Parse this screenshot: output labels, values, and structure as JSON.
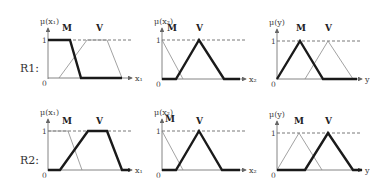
{
  "rules": [
    {
      "label": "R1:",
      "label_x": 20,
      "label_y": 72
    },
    {
      "label": "R2:",
      "label_x": 20,
      "label_y": 164
    }
  ],
  "panels": [
    {
      "id": "r1-x1",
      "ox": 48,
      "y0": 78,
      "y1": 40,
      "xend": 132,
      "ylabel": "μ(x₁)",
      "xlabel": "x₁",
      "sets": [
        {
          "name": "M",
          "label_x": 62,
          "label_y": 31,
          "bold": true,
          "points": [
            [
              48,
              40
            ],
            [
              70,
              40
            ],
            [
              81,
              78
            ],
            [
              122,
              78
            ]
          ]
        },
        {
          "name": "V",
          "label_x": 96,
          "label_y": 31,
          "bold": false,
          "points": [
            [
              59,
              78
            ],
            [
              87,
              40
            ],
            [
              107,
              40
            ],
            [
              122,
              78
            ]
          ]
        }
      ]
    },
    {
      "id": "r1-x2",
      "ox": 162,
      "y0": 79,
      "y1": 40,
      "xend": 246,
      "ylabel": "μ(x₂)",
      "xlabel": "x₂",
      "sets": [
        {
          "name": "M",
          "label_x": 167,
          "label_y": 31,
          "bold": false,
          "points": [
            [
              162,
              40
            ],
            [
              183,
              79
            ]
          ]
        },
        {
          "name": "V",
          "label_x": 196,
          "label_y": 31,
          "bold": true,
          "points": [
            [
              162,
              79
            ],
            [
              176,
              79
            ],
            [
              199,
              40
            ],
            [
              224,
              79
            ],
            [
              240,
              79
            ]
          ]
        }
      ]
    },
    {
      "id": "r1-y",
      "ox": 277,
      "y0": 79,
      "y1": 41,
      "xend": 362,
      "ylabel": "μ(y)",
      "xlabel": "y",
      "sets": [
        {
          "name": "M",
          "label_x": 296,
          "label_y": 31,
          "bold": true,
          "points": [
            [
              277,
              79
            ],
            [
              300,
              41
            ],
            [
              323,
              79
            ],
            [
              357,
              79
            ]
          ]
        },
        {
          "name": "V",
          "label_x": 325,
          "label_y": 31,
          "bold": false,
          "points": [
            [
              305,
              79
            ],
            [
              328,
              41
            ],
            [
              353,
              79
            ]
          ]
        }
      ]
    },
    {
      "id": "r2-x1",
      "ox": 48,
      "y0": 170,
      "y1": 131,
      "xend": 132,
      "ylabel": "μ(x₁)",
      "xlabel": "x₁",
      "sets": [
        {
          "name": "M",
          "label_x": 62,
          "label_y": 124,
          "bold": false,
          "points": [
            [
              48,
              131
            ],
            [
              68,
              131
            ],
            [
              82,
              170
            ]
          ]
        },
        {
          "name": "V",
          "label_x": 96,
          "label_y": 124,
          "bold": true,
          "points": [
            [
              48,
              170
            ],
            [
              60,
              170
            ],
            [
              88,
              131
            ],
            [
              107,
              131
            ],
            [
              122,
              170
            ],
            [
              130,
              170
            ]
          ]
        }
      ]
    },
    {
      "id": "r2-x2",
      "ox": 162,
      "y0": 170,
      "y1": 131,
      "xend": 246,
      "ylabel": "μ(x₂)",
      "xlabel": "x₂",
      "sets": [
        {
          "name": "M",
          "label_x": 165,
          "label_y": 122,
          "bold": false,
          "points": [
            [
              162,
              131
            ],
            [
              183,
              170
            ]
          ]
        },
        {
          "name": "V",
          "label_x": 196,
          "label_y": 124,
          "bold": true,
          "points": [
            [
              162,
              170
            ],
            [
              176,
              170
            ],
            [
              199,
              131
            ],
            [
              222,
              170
            ],
            [
              240,
              170
            ]
          ]
        }
      ]
    },
    {
      "id": "r2-y",
      "ox": 277,
      "y0": 170,
      "y1": 133,
      "xend": 362,
      "ylabel": "μ(y)",
      "xlabel": "y",
      "sets": [
        {
          "name": "M",
          "label_x": 294,
          "label_y": 124,
          "bold": false,
          "points": [
            [
              277,
              170
            ],
            [
              299,
              133
            ],
            [
              322,
              170
            ]
          ]
        },
        {
          "name": "V",
          "label_x": 325,
          "label_y": 124,
          "bold": true,
          "points": [
            [
              277,
              170
            ],
            [
              305,
              170
            ],
            [
              328,
              133
            ],
            [
              353,
              170
            ],
            [
              362,
              170
            ]
          ]
        }
      ]
    }
  ],
  "ticks": {
    "one": "1",
    "zero": "0"
  },
  "colors": {
    "bold": "#1a1a1a",
    "thin": "#8a8a8a",
    "axis": "#666666",
    "dash": "#555555"
  }
}
